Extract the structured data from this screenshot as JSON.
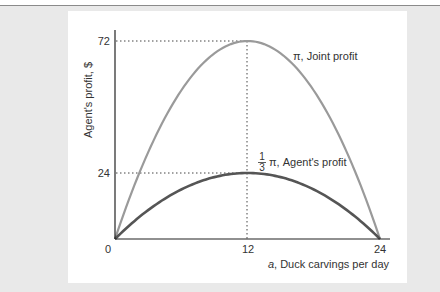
{
  "chart_data": {
    "type": "line",
    "title": "",
    "xlabel_var": "a",
    "xlabel": ", Duck carvings per day",
    "ylabel": "Agent's profit, $",
    "xlim": [
      0,
      24
    ],
    "ylim": [
      0,
      72
    ],
    "x_ticks": [
      "0",
      "12",
      "24"
    ],
    "y_ticks": [
      "24",
      "72"
    ],
    "grid": false,
    "reference_lines": [
      {
        "type": "horizontal",
        "y": 72,
        "x_to": 12,
        "style": "dotted"
      },
      {
        "type": "horizontal",
        "y": 24,
        "x_to": 12,
        "style": "dotted"
      },
      {
        "type": "vertical",
        "x": 12,
        "y_to": 72,
        "style": "dotted"
      }
    ],
    "x": [
      0,
      2,
      4,
      6,
      8,
      10,
      12,
      14,
      16,
      18,
      20,
      22,
      24
    ],
    "series": [
      {
        "name": "π, Joint profit",
        "color": "#9a9a9a",
        "values": [
          0,
          22,
          40,
          54,
          64,
          70,
          72,
          70,
          64,
          54,
          40,
          22,
          0
        ]
      },
      {
        "name": "1/3 π, Agent's profit",
        "color": "#555555",
        "values": [
          0,
          7.33,
          13.33,
          18,
          21.33,
          23.33,
          24,
          23.33,
          21.33,
          18,
          13.33,
          7.33,
          0
        ]
      }
    ],
    "annotations": {
      "joint": "π, Joint profit",
      "agent_frac_num": "1",
      "agent_frac_den": "3",
      "agent": "π, Agent's profit"
    }
  }
}
